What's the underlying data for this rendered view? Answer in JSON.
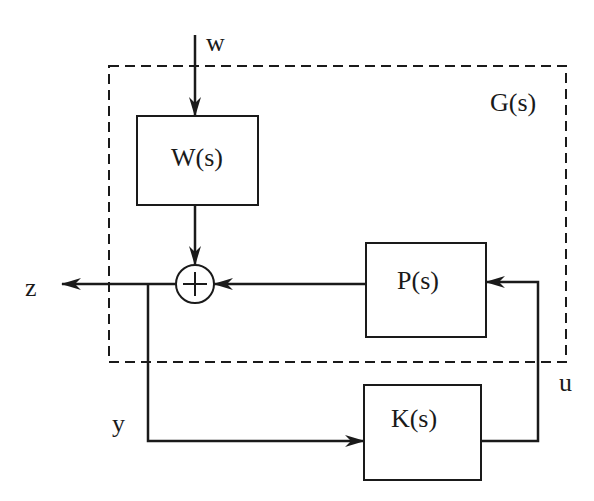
{
  "diagram": {
    "colors": {
      "stroke": "#1a1a1a",
      "background": "#ffffff"
    },
    "outer_box": {
      "label": "G(s)",
      "style": "dashed"
    },
    "blocks": [
      {
        "id": "W",
        "label": "W(s)"
      },
      {
        "id": "P",
        "label": "P(s)"
      },
      {
        "id": "K",
        "label": "K(s)"
      }
    ],
    "summing_junction": {
      "symbol": "+"
    },
    "signals": {
      "w": "w",
      "z": "z",
      "y": "y",
      "u": "u"
    },
    "connections": [
      {
        "from": "w",
        "to": "W(s)"
      },
      {
        "from": "W(s)",
        "to": "sum"
      },
      {
        "from": "P(s)",
        "to": "sum"
      },
      {
        "from": "sum",
        "to": "z"
      },
      {
        "from": "sum",
        "to": "K(s)",
        "signal": "y"
      },
      {
        "from": "K(s)",
        "to": "P(s)",
        "signal": "u"
      }
    ]
  }
}
